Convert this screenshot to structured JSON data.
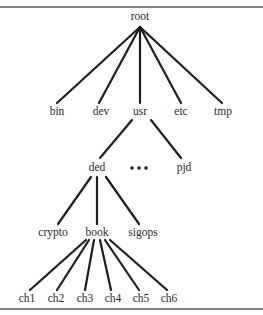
{
  "diagram": {
    "type": "directory-tree",
    "root": {
      "label": "root",
      "children": [
        {
          "label": "bin"
        },
        {
          "label": "dev"
        },
        {
          "label": "usr",
          "children": [
            {
              "label": "ded",
              "children": [
                {
                  "label": "crypto"
                },
                {
                  "label": "book",
                  "children": [
                    {
                      "label": "ch1"
                    },
                    {
                      "label": "ch2"
                    },
                    {
                      "label": "ch3"
                    },
                    {
                      "label": "ch4"
                    },
                    {
                      "label": "ch5"
                    },
                    {
                      "label": "ch6"
                    }
                  ]
                },
                {
                  "label": "sigops"
                }
              ]
            },
            {
              "label": "ellipsis",
              "display": "•••"
            },
            {
              "label": "pjd"
            }
          ]
        },
        {
          "label": "etc"
        },
        {
          "label": "tmp"
        }
      ]
    },
    "nodes": {
      "root": "root",
      "bin": "bin",
      "dev": "dev",
      "usr": "usr",
      "etc": "etc",
      "tmp": "tmp",
      "ded": "ded",
      "pjd": "pjd",
      "crypto": "crypto",
      "book": "book",
      "sigops": "sigops",
      "ch1": "ch1",
      "ch2": "ch2",
      "ch3": "ch3",
      "ch4": "ch4",
      "ch5": "ch5",
      "ch6": "ch6"
    },
    "colors": {
      "line": "#1e1e1e",
      "text": "#2a2a2a",
      "rule": "#5a5a5a",
      "background": "#ffffff"
    }
  }
}
